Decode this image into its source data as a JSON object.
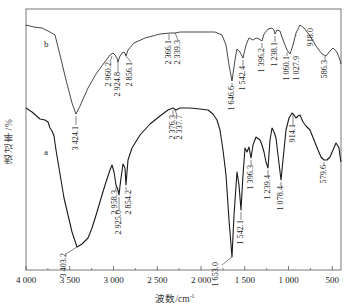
{
  "chart_data": {
    "type": "line",
    "title": "",
    "xlabel": "波数/cm⁻¹",
    "ylabel": "透过率/%",
    "xlim": [
      4000,
      400
    ],
    "x_reversed": true,
    "x_ticks": [
      4000,
      3500,
      3000,
      2500,
      2000,
      1500,
      1000,
      500
    ],
    "x_tick_labels": [
      "4 000",
      "3 500",
      "3 000",
      "2 500",
      "2 000",
      "1 500",
      "1 000",
      "500"
    ],
    "grid": false,
    "legend": "inline letters a, b",
    "series": [
      {
        "name": "b",
        "letter": "b",
        "peaks_cm-1": [
          3424.1,
          2960.2,
          2924.8,
          2856.1,
          2366.1,
          2339.3,
          1646.6,
          1542.4,
          1396.2,
          1238.1,
          1060.1,
          1027.9,
          918.0,
          586.3
        ],
        "peak_labels": [
          "3 424.1",
          "2 960.2",
          "2 924.8",
          "2 856.1",
          "2 366.1",
          "2 339.3",
          "1 646.6",
          "1 542.4",
          "1 396.2",
          "1 238.1",
          "1 060.1",
          "1 027.9",
          "918.0",
          "586.3"
        ],
        "trace_px": [
          [
            26,
            25
          ],
          [
            34,
            27
          ],
          [
            42,
            28
          ],
          [
            50,
            32
          ],
          [
            55,
            35
          ],
          [
            60,
            55
          ],
          [
            66,
            80
          ],
          [
            72,
            103
          ],
          [
            76,
            114
          ],
          [
            80,
            106
          ],
          [
            88,
            88
          ],
          [
            96,
            74
          ],
          [
            104,
            63
          ],
          [
            110,
            55
          ],
          [
            113,
            53
          ],
          [
            115,
            55
          ],
          [
            117,
            58
          ],
          [
            118,
            62
          ],
          [
            120,
            56
          ],
          [
            123,
            52
          ],
          [
            125,
            53
          ],
          [
            126,
            56
          ],
          [
            128,
            50
          ],
          [
            134,
            43
          ],
          [
            145,
            38
          ],
          [
            160,
            34
          ],
          [
            170,
            33
          ],
          [
            175,
            33
          ],
          [
            180,
            32
          ],
          [
            200,
            32
          ],
          [
            215,
            32
          ],
          [
            222,
            35
          ],
          [
            226,
            45
          ],
          [
            229,
            65
          ],
          [
            232,
            81
          ],
          [
            235,
            60
          ],
          [
            237,
            49
          ],
          [
            240,
            52
          ],
          [
            243,
            58
          ],
          [
            246,
            45
          ],
          [
            249,
            38
          ],
          [
            251,
            39
          ],
          [
            253,
            40
          ],
          [
            256,
            38
          ],
          [
            259,
            39
          ],
          [
            262,
            41
          ],
          [
            264,
            34
          ],
          [
            268,
            29
          ],
          [
            272,
            28
          ],
          [
            274,
            30
          ],
          [
            275,
            34
          ],
          [
            277,
            30
          ],
          [
            280,
            31
          ],
          [
            283,
            40
          ],
          [
            287,
            50
          ],
          [
            290,
            54
          ],
          [
            293,
            45
          ],
          [
            296,
            33
          ],
          [
            300,
            25
          ],
          [
            304,
            28
          ],
          [
            310,
            36
          ],
          [
            316,
            46
          ],
          [
            322,
            54
          ],
          [
            326,
            56
          ],
          [
            330,
            51
          ],
          [
            333,
            48
          ],
          [
            337,
            52
          ],
          [
            340,
            60
          ],
          [
            341,
            64
          ]
        ]
      },
      {
        "name": "a",
        "letter": "a",
        "peaks_cm-1": [
          3403.2,
          2958.3,
          2925.0,
          2854.2,
          2376.3,
          2337.7,
          1653.0,
          1542.1,
          1396.3,
          1239.4,
          1078.4,
          914.1,
          579.6
        ],
        "peak_labels": [
          "3 403.2",
          "2 958.3",
          "2 925.0",
          "2 854.2",
          "2 376.3",
          "2 337.7",
          "1 653.0",
          "1 542.1",
          "1 396.3",
          "1 239.4",
          "1 078.4",
          "914.1",
          "579.6"
        ],
        "trace_px": [
          [
            26,
            108
          ],
          [
            32,
            112
          ],
          [
            40,
            119
          ],
          [
            45,
            120
          ],
          [
            48,
            122
          ],
          [
            50,
            128
          ],
          [
            52,
            131
          ],
          [
            54,
            136
          ],
          [
            56,
            150
          ],
          [
            58,
            162
          ],
          [
            61,
            180
          ],
          [
            64,
            198
          ],
          [
            68,
            215
          ],
          [
            72,
            232
          ],
          [
            77,
            247
          ],
          [
            82,
            244
          ],
          [
            88,
            238
          ],
          [
            92,
            228
          ],
          [
            97,
            212
          ],
          [
            102,
            195
          ],
          [
            106,
            182
          ],
          [
            110,
            170
          ],
          [
            112,
            165
          ],
          [
            114,
            172
          ],
          [
            116,
            185
          ],
          [
            118,
            190
          ],
          [
            119,
            195
          ],
          [
            120,
            186
          ],
          [
            121,
            178
          ],
          [
            123,
            164
          ],
          [
            125,
            168
          ],
          [
            126,
            185
          ],
          [
            127,
            172
          ],
          [
            128,
            160
          ],
          [
            132,
            148
          ],
          [
            140,
            135
          ],
          [
            150,
            124
          ],
          [
            160,
            116
          ],
          [
            168,
            110
          ],
          [
            173,
            108
          ],
          [
            176,
            110
          ],
          [
            180,
            108
          ],
          [
            190,
            108
          ],
          [
            200,
            109
          ],
          [
            208,
            110
          ],
          [
            213,
            114
          ],
          [
            217,
            120
          ],
          [
            220,
            130
          ],
          [
            223,
            150
          ],
          [
            226,
            175
          ],
          [
            229,
            220
          ],
          [
            232,
            257
          ],
          [
            234,
            215
          ],
          [
            237,
            172
          ],
          [
            239,
            185
          ],
          [
            241,
            210
          ],
          [
            243,
            175
          ],
          [
            245,
            148
          ],
          [
            247,
            152
          ],
          [
            249,
            147
          ],
          [
            251,
            158
          ],
          [
            253,
            145
          ],
          [
            256,
            137
          ],
          [
            260,
            140
          ],
          [
            262,
            145
          ],
          [
            264,
            152
          ],
          [
            266,
            162
          ],
          [
            268,
            168
          ],
          [
            270,
            140
          ],
          [
            272,
            128
          ],
          [
            274,
            132
          ],
          [
            276,
            138
          ],
          [
            278,
            155
          ],
          [
            281,
            180
          ],
          [
            283,
            160
          ],
          [
            286,
            130
          ],
          [
            289,
            118
          ],
          [
            292,
            113
          ],
          [
            294,
            115
          ],
          [
            296,
            118
          ],
          [
            298,
            116
          ],
          [
            300,
            115
          ],
          [
            303,
            122
          ],
          [
            306,
            126
          ],
          [
            310,
            130
          ],
          [
            314,
            140
          ],
          [
            318,
            150
          ],
          [
            321,
            157
          ],
          [
            324,
            160
          ],
          [
            327,
            160
          ],
          [
            330,
            157
          ],
          [
            333,
            150
          ],
          [
            336,
            143
          ],
          [
            338,
            146
          ],
          [
            339,
            148
          ],
          [
            340,
            156
          ],
          [
            341,
            162
          ]
        ]
      }
    ]
  },
  "axes": {
    "ylabel": "透过率/%",
    "xlabel_main": "波数/cm",
    "xlabel_sup": "-1"
  }
}
